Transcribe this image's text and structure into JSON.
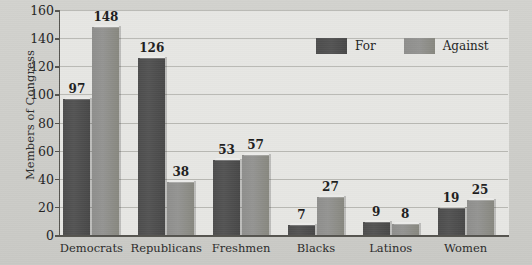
{
  "chart_data": {
    "type": "bar",
    "title": "",
    "xlabel": "",
    "ylabel": "Members of Congress",
    "categories": [
      "Democrats",
      "Republicans",
      "Freshmen",
      "Blacks",
      "Latinos",
      "Women"
    ],
    "series": [
      {
        "name": "For",
        "color": "#4d4d4d",
        "values": [
          97,
          126,
          53,
          7,
          9,
          19
        ]
      },
      {
        "name": "Against",
        "color": "#8e8e8c",
        "values": [
          148,
          38,
          57,
          27,
          8,
          25
        ]
      }
    ],
    "ylim": [
      0,
      160
    ],
    "yticks": [
      0,
      20,
      40,
      60,
      80,
      100,
      120,
      140,
      160
    ],
    "ytick_labels": [
      "0",
      "20",
      "40",
      "60",
      "80",
      "100",
      "120",
      "140",
      "160"
    ],
    "grid": true,
    "legend_position": "top-right",
    "plot_background": "#e6e6e3",
    "page_background": "#cfcfcb",
    "axis_color": "#55544f",
    "gridline_color": "#b9b9b4"
  },
  "legend": {
    "items": [
      {
        "label": "For",
        "swatch": "for"
      },
      {
        "label": "Against",
        "swatch": "against"
      }
    ]
  }
}
